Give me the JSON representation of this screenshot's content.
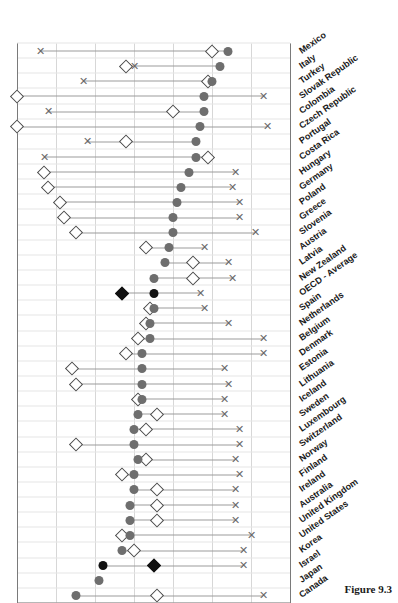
{
  "figure": {
    "caption": "Figure 9.3"
  },
  "chart_data": {
    "type": "scatter",
    "title": "",
    "subtitle": "",
    "xlabel": "",
    "ylabel": "",
    "orientation": "rotated-90",
    "grid": true,
    "legend_position": "none",
    "ylim": [
      0,
      70
    ],
    "ytick_labels": [
      "70",
      "60",
      "50",
      "40",
      "30",
      "20",
      "10",
      "0"
    ],
    "yticks": [
      70,
      60,
      50,
      40,
      30,
      20,
      10,
      0
    ],
    "value_axis_direction": "descending-left-to-right",
    "categories": [
      "Canada",
      "Japan",
      "Israel",
      "Korea",
      "United States",
      "United Kingdom",
      "Australia",
      "Ireland",
      "Finland",
      "Norway",
      "Switzerland",
      "Luxembourg",
      "Sweden",
      "Iceland",
      "Lithuania",
      "Estonia",
      "Denmark",
      "Belgium",
      "Netherlands",
      "Spain",
      "OECD - Average",
      "New Zealand",
      "Latvia",
      "Austria",
      "Slovenia",
      "Greece",
      "Poland",
      "Germany",
      "Hungary",
      "Costa Rica",
      "Portugal",
      "Czech Republic",
      "Colombia",
      "Slovak Republic",
      "Turkey",
      "Italy",
      "Mexico"
    ],
    "highlight_category": [
      "Israel",
      "OECD - Average"
    ],
    "series": [
      {
        "name": "circle",
        "marker": "filled-circle",
        "color": "#6e6e6e",
        "highlight_color": "#111111",
        "values": [
          55,
          49,
          48,
          43,
          41,
          41,
          41,
          40,
          40,
          39,
          40,
          40,
          39,
          38,
          38,
          38,
          38,
          36,
          36,
          35,
          35,
          35,
          32,
          31,
          30,
          30,
          29,
          28,
          26,
          24,
          24,
          23,
          22,
          22,
          20,
          18,
          16
        ]
      },
      {
        "name": "diamond",
        "marker": "open-diamond",
        "color": "#4a4a4a",
        "highlight_color": "#111111",
        "values": [
          34,
          null,
          35,
          40,
          43,
          34,
          34,
          34,
          43,
          37,
          55,
          37,
          34,
          39,
          55,
          56,
          42,
          39,
          37,
          36,
          43,
          25,
          25,
          37,
          55,
          58,
          59,
          62,
          63,
          21,
          42,
          70,
          30,
          70,
          21,
          42,
          20
        ]
      },
      {
        "name": "cross",
        "marker": "x",
        "color": "#6a6a6a",
        "values": [
          7,
          null,
          12,
          12,
          10,
          14,
          14,
          14,
          13,
          14,
          13,
          13,
          17,
          17,
          16,
          17,
          7,
          7,
          16,
          22,
          23,
          15,
          16,
          22,
          9,
          13,
          13,
          15,
          14,
          63,
          52,
          6,
          62,
          7,
          53,
          40,
          64
        ]
      }
    ]
  }
}
